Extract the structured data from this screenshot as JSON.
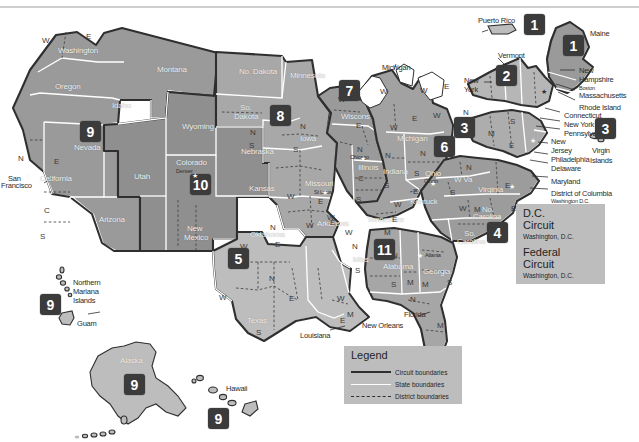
{
  "colors": {
    "badge": "#3b3b3b",
    "infobox": "#bdbdbd",
    "state_fill_dark": "#8a8a8a",
    "state_fill_mid": "#9e9e9e",
    "state_fill_light": "#c3c3c3",
    "circuit_boundary": "#2f2f2f",
    "state_boundary": "#ffffff",
    "district_boundary": "#2f2f2f",
    "background": "#ffffff"
  },
  "legend": {
    "title": "Legend",
    "rows": [
      {
        "label": "Circuit boundaries",
        "style": "solid-dark"
      },
      {
        "label": "State boundaries",
        "style": "solid-white"
      },
      {
        "label": "District boundaries",
        "style": "dashed-dark"
      }
    ]
  },
  "info_boxes": [
    {
      "name": "dc-circuit",
      "line1": "D.C.",
      "line2": "Circuit",
      "sub": "Washington, D.C."
    },
    {
      "name": "federal-circuit",
      "line1": "Federal",
      "line2": "Circuit",
      "sub": "Washington, D.C."
    }
  ],
  "circuit_badges": [
    {
      "number": "1",
      "name": "badge-circuit-1-puerto-rico",
      "x": 524,
      "y": 14
    },
    {
      "number": "1",
      "name": "badge-circuit-1-maine",
      "x": 563,
      "y": 35
    },
    {
      "number": "2",
      "name": "badge-circuit-2",
      "x": 496,
      "y": 65
    },
    {
      "number": "3",
      "name": "badge-circuit-3",
      "x": 454,
      "y": 117
    },
    {
      "number": "3",
      "name": "badge-circuit-3-virgin-islands",
      "x": 595,
      "y": 118
    },
    {
      "number": "4",
      "name": "badge-circuit-4",
      "x": 487,
      "y": 222
    },
    {
      "number": "5",
      "name": "badge-circuit-5",
      "x": 228,
      "y": 248
    },
    {
      "number": "6",
      "name": "badge-circuit-6",
      "x": 434,
      "y": 136
    },
    {
      "number": "7",
      "name": "badge-circuit-7",
      "x": 339,
      "y": 80
    },
    {
      "number": "8",
      "name": "badge-circuit-8",
      "x": 270,
      "y": 105
    },
    {
      "number": "9",
      "name": "badge-circuit-9-west",
      "x": 80,
      "y": 121
    },
    {
      "number": "9",
      "name": "badge-circuit-9-pacific",
      "x": 40,
      "y": 294
    },
    {
      "number": "9",
      "name": "badge-circuit-9-alaska",
      "x": 124,
      "y": 374
    },
    {
      "number": "9",
      "name": "badge-circuit-9-hawaii",
      "x": 208,
      "y": 408
    },
    {
      "number": "10",
      "name": "badge-circuit-10",
      "x": 190,
      "y": 174
    },
    {
      "number": "11",
      "name": "badge-circuit-11",
      "x": 374,
      "y": 239
    }
  ],
  "state_labels_inside": [
    {
      "text": "Washington",
      "x": 58,
      "y": 47
    },
    {
      "text": "Oregon",
      "x": 55,
      "y": 83
    },
    {
      "text": "Idaho",
      "x": 112,
      "y": 102
    },
    {
      "text": "Montana",
      "x": 157,
      "y": 66
    },
    {
      "text": "Wyoming",
      "x": 182,
      "y": 123
    },
    {
      "text": "Nevada",
      "x": 74,
      "y": 144
    },
    {
      "text": "Utah",
      "x": 134,
      "y": 173
    },
    {
      "text": "Colorado",
      "x": 176,
      "y": 159
    },
    {
      "text": "California",
      "x": 40,
      "y": 175
    },
    {
      "text": "Arizona",
      "x": 99,
      "y": 216
    },
    {
      "text": "New",
      "x": 187,
      "y": 225
    },
    {
      "text": "Mexico",
      "x": 184,
      "y": 234
    },
    {
      "text": "No. Dakota",
      "x": 239,
      "y": 68
    },
    {
      "text": "So.",
      "x": 240,
      "y": 104
    },
    {
      "text": "Dakota",
      "x": 234,
      "y": 113
    },
    {
      "text": "Nebraska",
      "x": 241,
      "y": 148
    },
    {
      "text": "Kansas",
      "x": 249,
      "y": 185
    },
    {
      "text": "Minnesota",
      "x": 290,
      "y": 72
    },
    {
      "text": "Iowa",
      "x": 300,
      "y": 135
    },
    {
      "text": "Missouri",
      "x": 305,
      "y": 180
    },
    {
      "text": "Arkansas",
      "x": 317,
      "y": 220
    },
    {
      "text": "Oklahoma",
      "x": 250,
      "y": 231
    },
    {
      "text": "Texas",
      "x": 247,
      "y": 317
    },
    {
      "text": "Wiscons",
      "x": 341,
      "y": 113
    },
    {
      "text": "Michigan",
      "x": 397,
      "y": 135
    },
    {
      "text": "Illinois",
      "x": 358,
      "y": 164
    },
    {
      "text": "Indiana",
      "x": 383,
      "y": 168
    },
    {
      "text": "Ohio",
      "x": 425,
      "y": 170
    },
    {
      "text": "Kentuck",
      "x": 410,
      "y": 198
    },
    {
      "text": "Tennessee",
      "x": 367,
      "y": 216
    },
    {
      "text": "Miss",
      "x": 353,
      "y": 256
    },
    {
      "text": "Alabama",
      "x": 383,
      "y": 263
    },
    {
      "text": "Georgia",
      "x": 423,
      "y": 268
    },
    {
      "text": "W Va",
      "x": 454,
      "y": 176
    },
    {
      "text": "Virginia",
      "x": 478,
      "y": 186
    },
    {
      "text": "No.",
      "x": 482,
      "y": 206
    },
    {
      "text": "Carolina",
      "x": 473,
      "y": 213
    },
    {
      "text": "So.",
      "x": 464,
      "y": 230
    },
    {
      "text": "Carolina",
      "x": 457,
      "y": 238
    },
    {
      "text": "Alaska",
      "x": 120,
      "y": 357
    }
  ],
  "state_labels_outside": [
    {
      "text": "Michigan",
      "x": 382,
      "y": 64
    },
    {
      "text": "Puerto Rico",
      "x": 478,
      "y": 17
    },
    {
      "text": "Maine",
      "x": 590,
      "y": 30
    },
    {
      "text": "Vermont",
      "x": 498,
      "y": 52
    },
    {
      "text": "New",
      "x": 464,
      "y": 77
    },
    {
      "text": "York",
      "x": 464,
      "y": 86
    },
    {
      "text": "New",
      "x": 579,
      "y": 67
    },
    {
      "text": "Hampshire",
      "x": 579,
      "y": 76
    },
    {
      "text": "Massachusetts",
      "x": 579,
      "y": 92
    },
    {
      "text": "Rhode Island",
      "x": 579,
      "y": 104
    },
    {
      "text": "Connecticut",
      "x": 564,
      "y": 112
    },
    {
      "text": "New York",
      "x": 564,
      "y": 121
    },
    {
      "text": "Pennsylvania",
      "x": 564,
      "y": 130
    },
    {
      "text": "New",
      "x": 551,
      "y": 138
    },
    {
      "text": "Jersey",
      "x": 551,
      "y": 147
    },
    {
      "text": "Philadelphia",
      "x": 551,
      "y": 156
    },
    {
      "text": "Delaware",
      "x": 551,
      "y": 165
    },
    {
      "text": "Maryland",
      "x": 551,
      "y": 178
    },
    {
      "text": "District of Columbia",
      "x": 551,
      "y": 190
    },
    {
      "text": "Richmond",
      "x": 551,
      "y": 208
    },
    {
      "text": "Virgin",
      "x": 592,
      "y": 147
    },
    {
      "text": "Islands",
      "x": 590,
      "y": 157
    },
    {
      "text": "Florida",
      "x": 404,
      "y": 311
    },
    {
      "text": "Louisiana",
      "x": 300,
      "y": 332
    },
    {
      "text": "New Orleans",
      "x": 362,
      "y": 322
    },
    {
      "text": "Northern",
      "x": 73,
      "y": 279
    },
    {
      "text": "Mariana",
      "x": 73,
      "y": 288
    },
    {
      "text": "Islands",
      "x": 73,
      "y": 297
    },
    {
      "text": "Guam",
      "x": 77,
      "y": 320
    },
    {
      "text": "Hawaii",
      "x": 226,
      "y": 385
    },
    {
      "text": "San",
      "x": 8,
      "y": 175
    },
    {
      "text": "Francisco",
      "x": 1,
      "y": 182
    }
  ],
  "small_labels": [
    {
      "text": "Washington D.C.",
      "x": 551,
      "y": 199
    },
    {
      "text": "Boston",
      "x": 579,
      "y": 86
    },
    {
      "text": "Denver",
      "x": 176,
      "y": 169
    },
    {
      "text": "Chicago",
      "x": 350,
      "y": 155
    },
    {
      "text": "St Louis",
      "x": 314,
      "y": 190
    },
    {
      "text": "Cincin",
      "x": 424,
      "y": 179
    },
    {
      "text": "Atlanta",
      "x": 425,
      "y": 253
    }
  ],
  "district_letters": [
    {
      "l": "W",
      "x": 42,
      "y": 37
    },
    {
      "l": "E",
      "x": 86,
      "y": 33
    },
    {
      "l": "N",
      "x": 18,
      "y": 155
    },
    {
      "l": "E",
      "x": 54,
      "y": 158
    },
    {
      "l": "C",
      "x": 44,
      "y": 207
    },
    {
      "l": "S",
      "x": 40,
      "y": 233
    },
    {
      "l": "N",
      "x": 250,
      "y": 129
    },
    {
      "l": "S",
      "x": 249,
      "y": 142
    },
    {
      "l": "N",
      "x": 300,
      "y": 123
    },
    {
      "l": "S",
      "x": 293,
      "y": 146
    },
    {
      "l": "W",
      "x": 287,
      "y": 193
    },
    {
      "l": "E",
      "x": 318,
      "y": 198
    },
    {
      "l": "W",
      "x": 306,
      "y": 222
    },
    {
      "l": "E",
      "x": 330,
      "y": 219
    },
    {
      "l": "N",
      "x": 270,
      "y": 224
    },
    {
      "l": "E",
      "x": 275,
      "y": 241
    },
    {
      "l": "W",
      "x": 240,
      "y": 243
    },
    {
      "l": "N",
      "x": 269,
      "y": 275
    },
    {
      "l": "W",
      "x": 219,
      "y": 294
    },
    {
      "l": "E",
      "x": 289,
      "y": 295
    },
    {
      "l": "S",
      "x": 256,
      "y": 329
    },
    {
      "l": "W",
      "x": 337,
      "y": 295
    },
    {
      "l": "N",
      "x": 352,
      "y": 243
    },
    {
      "l": "S",
      "x": 355,
      "y": 267
    },
    {
      "l": "M",
      "x": 347,
      "y": 311
    },
    {
      "l": "E",
      "x": 340,
      "y": 317
    },
    {
      "l": "W",
      "x": 338,
      "y": 96
    },
    {
      "l": "E",
      "x": 356,
      "y": 122
    },
    {
      "l": "N",
      "x": 357,
      "y": 146
    },
    {
      "l": "C",
      "x": 358,
      "y": 175
    },
    {
      "l": "S",
      "x": 356,
      "y": 196
    },
    {
      "l": "W",
      "x": 380,
      "y": 88
    },
    {
      "l": "W",
      "x": 390,
      "y": 124
    },
    {
      "l": "E",
      "x": 412,
      "y": 115
    },
    {
      "l": "N",
      "x": 385,
      "y": 152
    },
    {
      "l": "S",
      "x": 384,
      "y": 182
    },
    {
      "l": "N",
      "x": 420,
      "y": 150
    },
    {
      "l": "S",
      "x": 414,
      "y": 170
    },
    {
      "l": "E",
      "x": 413,
      "y": 188
    },
    {
      "l": "W",
      "x": 394,
      "y": 201
    },
    {
      "l": "W",
      "x": 420,
      "y": 87
    },
    {
      "l": "E",
      "x": 444,
      "y": 83
    },
    {
      "l": "W",
      "x": 433,
      "y": 112
    },
    {
      "l": "N",
      "x": 463,
      "y": 109
    },
    {
      "l": "W",
      "x": 446,
      "y": 142
    },
    {
      "l": "M",
      "x": 488,
      "y": 130
    },
    {
      "l": "E",
      "x": 509,
      "y": 142
    },
    {
      "l": "S",
      "x": 510,
      "y": 118
    },
    {
      "l": "N",
      "x": 466,
      "y": 164
    },
    {
      "l": "S",
      "x": 450,
      "y": 189
    },
    {
      "l": "E",
      "x": 505,
      "y": 182
    },
    {
      "l": "W",
      "x": 459,
      "y": 205
    },
    {
      "l": "M",
      "x": 474,
      "y": 206
    },
    {
      "l": "E",
      "x": 511,
      "y": 205
    },
    {
      "l": "W",
      "x": 327,
      "y": 214
    },
    {
      "l": "M",
      "x": 384,
      "y": 229
    },
    {
      "l": "W",
      "x": 345,
      "y": 229
    },
    {
      "l": "E",
      "x": 392,
      "y": 216
    },
    {
      "l": "N",
      "x": 392,
      "y": 252
    },
    {
      "l": "M",
      "x": 407,
      "y": 279
    },
    {
      "l": "S",
      "x": 391,
      "y": 281
    },
    {
      "l": "M",
      "x": 422,
      "y": 281
    },
    {
      "l": "S",
      "x": 447,
      "y": 279
    },
    {
      "l": "N",
      "x": 410,
      "y": 296
    },
    {
      "l": "M",
      "x": 437,
      "y": 322
    },
    {
      "l": "S",
      "x": 434,
      "y": 345
    }
  ]
}
